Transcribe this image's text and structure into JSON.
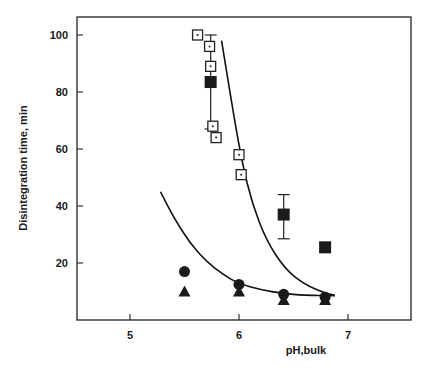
{
  "chart_data": {
    "type": "scatter",
    "title": "",
    "xlabel": "pH,bulk",
    "ylabel": "Disintegration time, min",
    "xlim": [
      4.5,
      7.55
    ],
    "ylim": [
      0,
      105
    ],
    "xticks": [
      5,
      6,
      7
    ],
    "yticks": [
      20,
      40,
      60,
      80,
      100
    ],
    "grid": false,
    "legend": null,
    "series": [
      {
        "name": "open square (dotted center)",
        "marker": "open-square-dot",
        "points": [
          [
            5.62,
            100
          ],
          [
            5.73,
            96
          ],
          [
            5.74,
            89
          ],
          [
            5.76,
            68
          ],
          [
            5.79,
            64
          ],
          [
            6.0,
            58
          ],
          [
            6.02,
            51
          ]
        ]
      },
      {
        "name": "filled square",
        "marker": "filled-square",
        "points": [
          [
            5.74,
            83.5
          ],
          [
            6.41,
            37
          ],
          [
            6.79,
            25.5
          ]
        ],
        "error_bars": [
          [
            5.74,
            67,
            100
          ],
          [
            6.41,
            28.5,
            44
          ],
          null
        ]
      },
      {
        "name": "filled circle",
        "marker": "filled-circle",
        "points": [
          [
            5.5,
            17
          ],
          [
            6.0,
            12.5
          ],
          [
            6.41,
            9
          ],
          [
            6.79,
            8
          ]
        ]
      },
      {
        "name": "filled triangle",
        "marker": "filled-triangle",
        "points": [
          [
            5.5,
            10
          ],
          [
            6.0,
            10
          ],
          [
            6.41,
            7
          ],
          [
            6.79,
            7
          ]
        ]
      }
    ],
    "fit_curves": [
      {
        "name": "upper curve (squares)",
        "points": [
          [
            5.84,
            98
          ],
          [
            5.9,
            84
          ],
          [
            5.96,
            70
          ],
          [
            6.03,
            55
          ],
          [
            6.12,
            41
          ],
          [
            6.25,
            28
          ],
          [
            6.42,
            18
          ],
          [
            6.6,
            12.5
          ],
          [
            6.8,
            9.3
          ],
          [
            6.88,
            8.7
          ]
        ]
      },
      {
        "name": "lower curve (circles/triangles)",
        "points": [
          [
            5.28,
            45
          ],
          [
            5.4,
            36
          ],
          [
            5.55,
            27
          ],
          [
            5.7,
            20.5
          ],
          [
            5.85,
            16
          ],
          [
            6.0,
            12.7
          ],
          [
            6.2,
            10.6
          ],
          [
            6.4,
            9.3
          ],
          [
            6.6,
            8.7
          ],
          [
            6.88,
            8.5
          ]
        ]
      }
    ]
  }
}
